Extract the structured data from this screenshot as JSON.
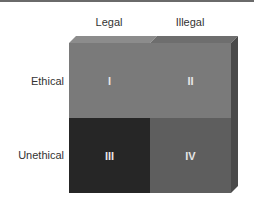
{
  "columns": [
    "Legal",
    "Illegal"
  ],
  "rows": [
    "Ethical",
    "Unethical"
  ],
  "cells": [
    {
      "label": "I",
      "row": "Ethical",
      "column": "Legal",
      "color": "#7a7a7a"
    },
    {
      "label": "II",
      "row": "Ethical",
      "column": "Illegal",
      "color": "#7a7a7a"
    },
    {
      "label": "III",
      "row": "Unethical",
      "column": "Legal",
      "color": "#262626"
    },
    {
      "label": "IV",
      "row": "Unethical",
      "column": "Illegal",
      "color": "#5e5e5e"
    }
  ],
  "colors": {
    "top_face_left": "#8c8c8c",
    "top_face_right": "#6e6e6e",
    "right_face": "#4a4a4a"
  }
}
